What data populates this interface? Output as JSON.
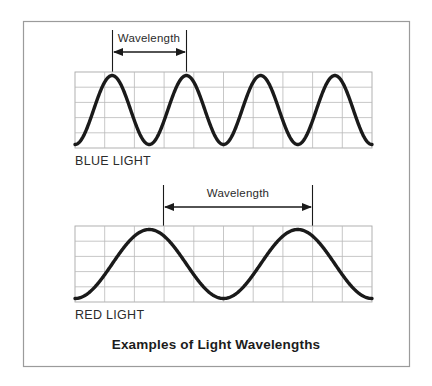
{
  "figure": {
    "title": "Examples of Light Wavelengths",
    "border_color": "#9b9b9b",
    "background_color": "#ffffff",
    "wave_color": "#1a1a1a",
    "grid_color": "#b9b9b9"
  },
  "sections": [
    {
      "id": "blue-light",
      "label": "BLUE LIGHT",
      "measure_label": "Wavelength",
      "cycles": 4,
      "grid_columns": 10,
      "grid_rows": 5
    },
    {
      "id": "red-light",
      "label": "RED LIGHT",
      "measure_label": "Wavelength",
      "cycles": 2,
      "grid_columns": 10,
      "grid_rows": 5
    }
  ],
  "chart_data": {
    "type": "line",
    "title": "Examples of Light Wavelengths",
    "xlabel": "",
    "ylabel": "",
    "grid": true,
    "legend": "none",
    "series": [
      {
        "name": "BLUE LIGHT",
        "waveform": "sine",
        "cycles": 4,
        "amplitude": 1,
        "x_range": [
          0,
          4
        ],
        "y_range": [
          -1,
          1
        ],
        "annotation": "Wavelength",
        "annotation_span_cycles": 1
      },
      {
        "name": "RED LIGHT",
        "waveform": "sine",
        "cycles": 2,
        "amplitude": 1,
        "x_range": [
          0,
          2
        ],
        "y_range": [
          -1,
          1
        ],
        "annotation": "Wavelength",
        "annotation_span_cycles": 1
      }
    ]
  }
}
